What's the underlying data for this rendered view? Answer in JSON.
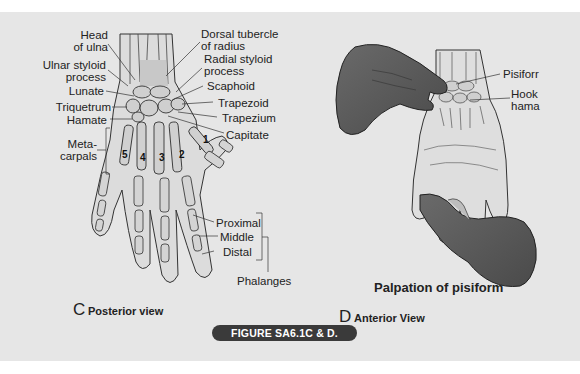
{
  "figure": {
    "badge": "FIGURE SA6.1C & D.",
    "background_color": "#e6e6e6",
    "badge_color": "#3a3a3a"
  },
  "panel_c": {
    "letter": "C",
    "caption": "Posterior view",
    "labels_left": {
      "head_of_ulna": "Head\nof ulna",
      "head_line1": "Head",
      "head_line2": "of ulna",
      "ulnar_line1": "Ulnar styloid",
      "ulnar_line2": "process",
      "lunate": "Lunate",
      "triquetrum": "Triquetrum",
      "hamate": "Hamate",
      "meta_line1": "Meta-",
      "meta_line2": "carpals"
    },
    "labels_right": {
      "dorsal_line1": "Dorsal tubercle",
      "dorsal_line2": "of radius",
      "radial_line1": "Radial styloid",
      "radial_line2": "process",
      "scaphoid": "Scaphoid",
      "trapezoid": "Trapezoid",
      "trapezium": "Trapezium",
      "capitate": "Capitate"
    },
    "metacarpal_numbers": [
      "1",
      "2",
      "3",
      "4",
      "5"
    ],
    "phalanges": {
      "proximal": "Proximal",
      "middle": "Middle",
      "distal": "Distal",
      "group": "Phalanges"
    }
  },
  "panel_d": {
    "letter": "D",
    "caption": "Anterior View",
    "title": "Palpation of pisiform",
    "labels": {
      "pisiform": "Pisiforr",
      "hook_line1": "Hook",
      "hook_line2": "hama"
    }
  }
}
